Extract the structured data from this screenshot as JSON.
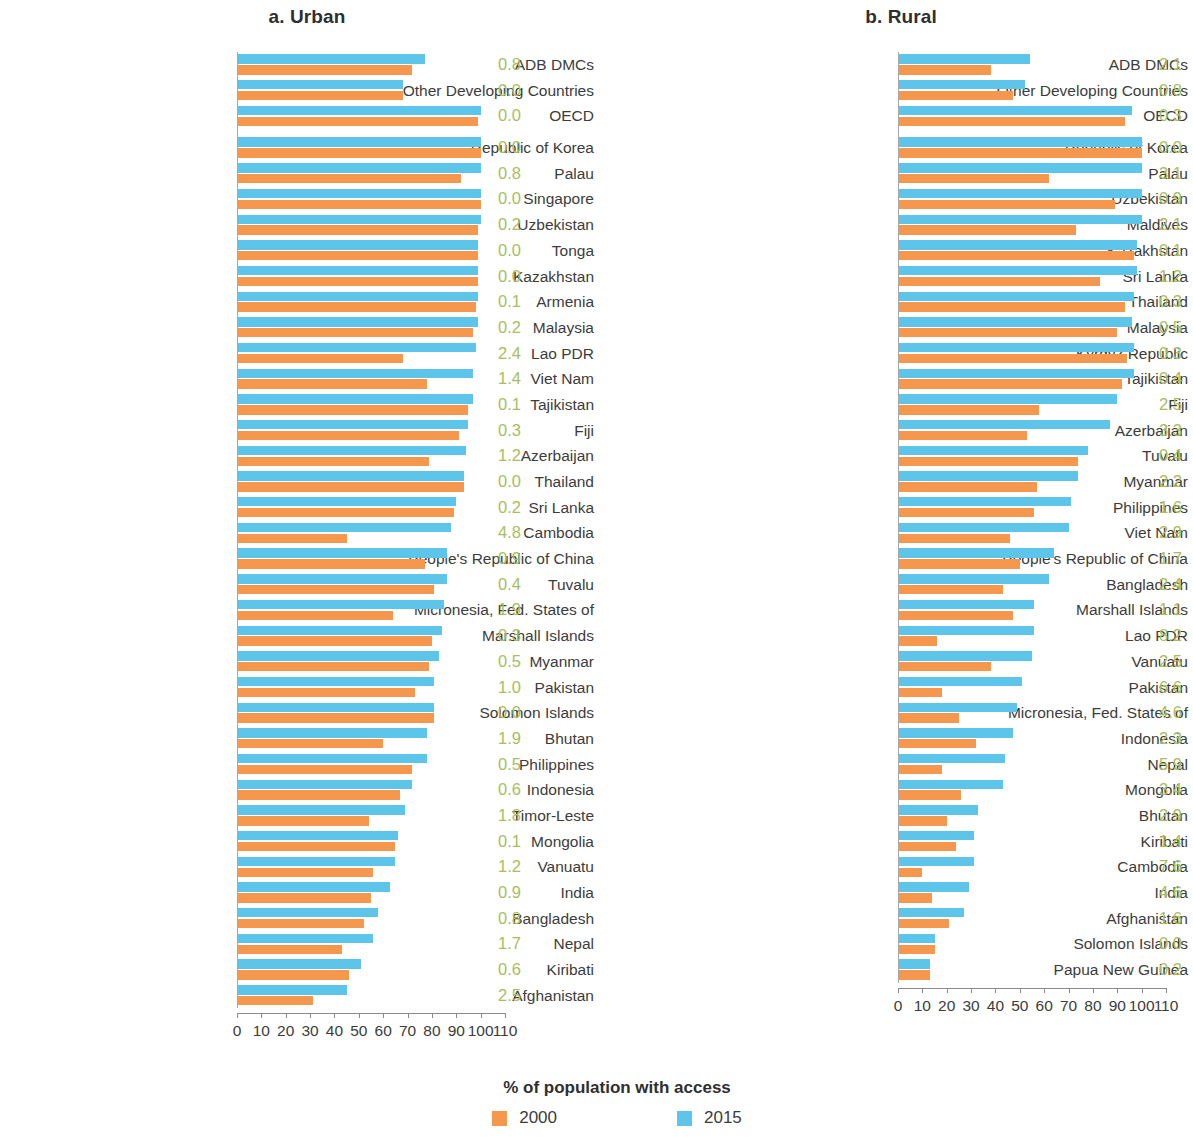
{
  "chart_data": {
    "type": "bar",
    "orientation": "horizontal",
    "title": "",
    "xlabel": "% of population with access",
    "ylabel": "",
    "xlim": [
      0,
      110
    ],
    "xticks": [
      0,
      10,
      20,
      30,
      40,
      50,
      60,
      70,
      80,
      90,
      100,
      110
    ],
    "xtick_labels": [
      "0",
      "10",
      "20",
      "30",
      "40",
      "50",
      "60",
      "70",
      "80",
      "90",
      "100",
      "110"
    ],
    "grid": false,
    "legend_position": "bottom",
    "legend_title": "% of population with access",
    "series_names": [
      "2000",
      "2015"
    ],
    "colors": {
      "2000": "#f6974e",
      "2015": "#5dc4ea",
      "value_label": "#a9bd5d"
    },
    "value_label_note": "annual growth rate (%) shown at right of each pair",
    "panels": [
      {
        "key": "urban",
        "title": "a. Urban",
        "categories": [
          "ADB DMCs",
          "Other Developing Countries",
          "OECD",
          "Republic of Korea",
          "Palau",
          "Singapore",
          "Uzbekistan",
          "Tonga",
          "Kazakhstan",
          "Armenia",
          "Malaysia",
          "Lao PDR",
          "Viet Nam",
          "Tajikistan",
          "Fiji",
          "Azerbaijan",
          "Thailand",
          "Sri Lanka",
          "Cambodia",
          "People's Republic of China",
          "Tuvalu",
          "Micronesia, Fed. States of",
          "Marshall Islands",
          "Myanmar",
          "Pakistan",
          "Solomon Islands",
          "Bhutan",
          "Philippines",
          "Indonesia",
          "Timor-Leste",
          "Mongolia",
          "Vanuatu",
          "India",
          "Bangladesh",
          "Nepal",
          "Kiribati",
          "Afghanistan"
        ],
        "group_break_after_index": 2,
        "series": [
          {
            "name": "2000",
            "values": [
              72.0,
              68.0,
              99.0,
              100.0,
              92.0,
              100.0,
              99.0,
              99.0,
              99.0,
              98.0,
              97.0,
              68.0,
              78.0,
              95.0,
              91.0,
              79.0,
              93.0,
              89.0,
              45.0,
              77.0,
              81.0,
              64.0,
              80.0,
              79.0,
              73.0,
              81.0,
              60.0,
              72.0,
              67.0,
              54.0,
              65.0,
              56.0,
              55.0,
              52.0,
              43.0,
              46.0,
              31.0
            ]
          },
          {
            "name": "2015",
            "values": [
              77.0,
              68.0,
              100.0,
              100.0,
              100.0,
              100.0,
              100.0,
              99.0,
              99.0,
              99.0,
              99.0,
              98.0,
              97.0,
              97.0,
              95.0,
              94.0,
              93.0,
              90.0,
              88.0,
              86.0,
              86.0,
              85.0,
              84.0,
              83.0,
              81.0,
              81.0,
              78.0,
              78.0,
              72.0,
              69.0,
              66.0,
              65.0,
              63.0,
              58.0,
              56.0,
              51.0,
              45.0
            ]
          }
        ],
        "value_labels": [
          "0.8",
          "0.0",
          "0.0",
          "0.0",
          "0.8",
          "0.0",
          "0.2",
          "0.0",
          "0.0",
          "0.1",
          "0.2",
          "2.4",
          "1.4",
          "0.1",
          "0.3",
          "1.2",
          "0.0",
          "0.2",
          "4.8",
          "0.9",
          "0.4",
          "1.9",
          "0.3",
          "0.5",
          "1.0",
          "0.0",
          "1.9",
          "0.5",
          "0.6",
          "1.8",
          "0.1",
          "1.2",
          "0.9",
          "0.8",
          "1.7",
          "0.6",
          "2.5"
        ]
      },
      {
        "key": "rural",
        "title": "b. Rural",
        "categories": [
          "ADB DMCs",
          "Other Developing Countries",
          "OECD",
          "Republic of Korea",
          "Palau",
          "Uzbekistan",
          "Maldives",
          "Kazakhstan",
          "Sri Lanka",
          "Thailand",
          "Malaysia",
          "Kyrgyz Republic",
          "Tajikistan",
          "Fiji",
          "Azerbaijan",
          "Tuvalu",
          "Myanmar",
          "Philippines",
          "Viet Nam",
          "People's Republic of China",
          "Bangladesh",
          "Marshall Islands",
          "Lao PDR",
          "Vanuatu",
          "Pakistan",
          "Micronesia, Fed. States of",
          "Indonesia",
          "Nepal",
          "Mongolia",
          "Bhutan",
          "Kiribati",
          "Cambodia",
          "India",
          "Afghanistan",
          "Solomon Islands",
          "Papua New Guinea"
        ],
        "group_break_after_index": 2,
        "series": [
          {
            "name": "2000",
            "values": [
              38.0,
              47.0,
              93.0,
              100.0,
              62.0,
              89.0,
              73.0,
              97.0,
              83.0,
              93.0,
              90.0,
              94.0,
              92.0,
              58.0,
              53.0,
              74.0,
              57.0,
              56.0,
              46.0,
              50.0,
              43.0,
              47.0,
              16.0,
              38.0,
              18.0,
              25.0,
              32.0,
              18.0,
              26.0,
              20.0,
              24.0,
              10.0,
              14.0,
              21.0,
              15.0,
              13.0
            ]
          },
          {
            "name": "2015",
            "values": [
              54.0,
              52.0,
              96.0,
              100.0,
              100.0,
              100.0,
              100.0,
              98.0,
              98.0,
              97.0,
              96.0,
              97.0,
              97.0,
              90.0,
              87.0,
              78.0,
              74.0,
              71.0,
              70.0,
              64.0,
              62.0,
              56.0,
              56.0,
              55.0,
              51.0,
              49.0,
              47.0,
              44.0,
              43.0,
              33.0,
              31.0,
              31.0,
              29.0,
              27.0,
              15.0,
              13.0
            ]
          }
        ],
        "value_labels": [
          "2.1",
          "0.8",
          "0.3",
          "0.0",
          "3.1",
          "0.9",
          "2.1",
          "0.1",
          "1.2",
          "0.3",
          "0.5",
          "0.3",
          "0.4",
          "2.5",
          "3.3",
          "0.4",
          "2.2",
          "1.6",
          "2.9",
          "1.7",
          "2.4",
          "1.1",
          "8.2",
          "2.5",
          "6.6",
          "4.6",
          "2.3",
          "5.9",
          "3.4",
          "2.9",
          "1.4",
          "7.6",
          "4.6",
          "1.6",
          "0.0",
          "0.2"
        ]
      }
    ]
  }
}
